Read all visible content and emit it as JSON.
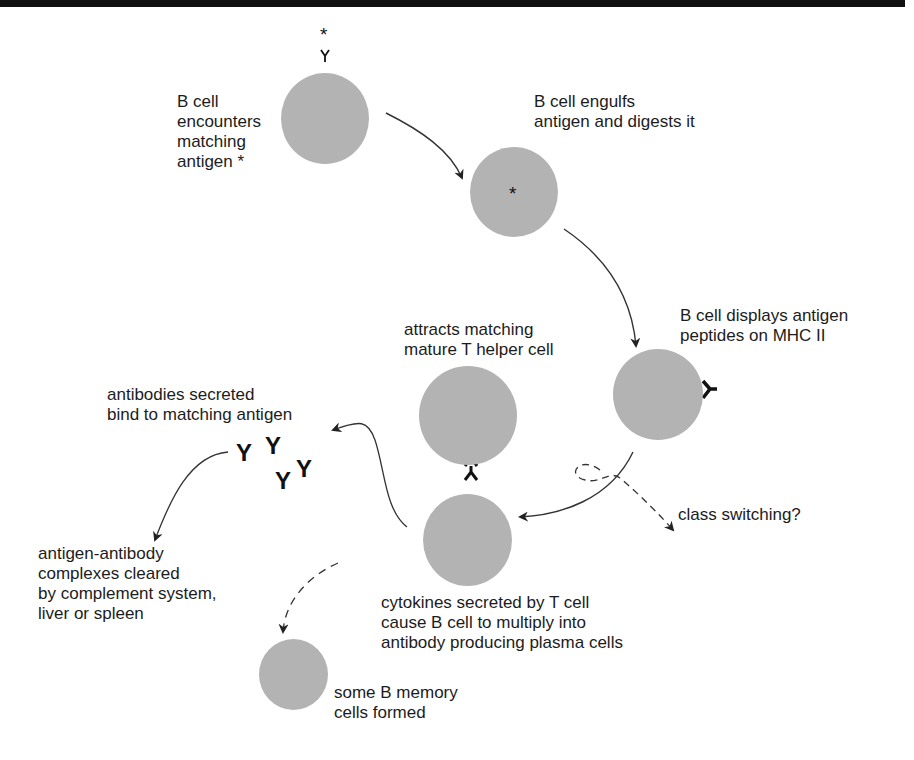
{
  "diagram": {
    "colors": {
      "cell_fill": "#b3b3b3",
      "line": "#333333",
      "text": "#1c1c1c",
      "top_bar": "#111111"
    },
    "nodes": [
      {
        "id": "b-cell-encounter",
        "label": "B cell\nencounters\nmatching\nantigen *"
      },
      {
        "id": "b-cell-engulf",
        "label": "B cell engulfs\nantigen and digests it"
      },
      {
        "id": "b-cell-display",
        "label": "B cell displays antigen\npeptides on MHC II"
      },
      {
        "id": "t-helper",
        "label": "attracts matching\nmature T helper cell"
      },
      {
        "id": "plasma",
        "label": "cytokines secreted by T cell\ncause B cell to multiply into\nantibody producing plasma cells"
      },
      {
        "id": "antibodies",
        "label": "antibodies secreted\nbind to matching antigen"
      },
      {
        "id": "complexes",
        "label": "antigen-antibody\ncomplexes cleared\nby complement system,\nliver or spleen"
      },
      {
        "id": "memory",
        "label": "some B memory\ncells formed"
      },
      {
        "id": "class-switching",
        "label": "class switching?"
      }
    ],
    "symbols": {
      "antigen": "*",
      "receptor": "Y",
      "antibody": "Y"
    }
  }
}
